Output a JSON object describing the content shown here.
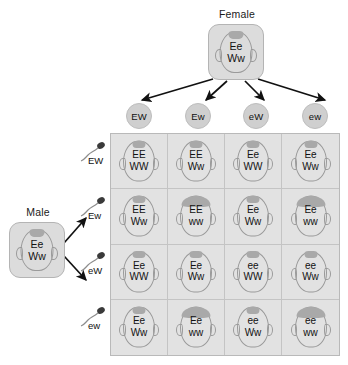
{
  "diagram": {
    "title_female": "Female",
    "title_male": "Male",
    "female_genotype_line1": "Ee",
    "female_genotype_line2": "Ww",
    "male_genotype_line1": "Ee",
    "male_genotype_line2": "Ww",
    "arrow_color": "#111111",
    "box_fill": "#dcdcdc",
    "box_stroke": "#b4b4b4",
    "grid_fill": "#e2e2e2",
    "grid_line": "#c4c4c4",
    "hair_color": "#a9a9a9",
    "outline_color": "#9a9a9a"
  },
  "eggs": [
    {
      "label": "EW"
    },
    {
      "label": "Ew"
    },
    {
      "label": "eW"
    },
    {
      "label": "ew"
    }
  ],
  "sperm": [
    {
      "label": "EW"
    },
    {
      "label": "Ew"
    },
    {
      "label": "eW"
    },
    {
      "label": "ew"
    }
  ],
  "chart_data": {
    "type": "table",
    "xlabel": "Female gametes",
    "ylabel": "Male gametes",
    "categories": [
      "EW",
      "Ew",
      "eW",
      "ew"
    ],
    "row_categories": [
      "EW",
      "Ew",
      "eW",
      "ew"
    ],
    "cells": [
      [
        {
          "line1": "EE",
          "line2": "WW",
          "hair": "peak"
        },
        {
          "line1": "EE",
          "line2": "Ww",
          "hair": "peak"
        },
        {
          "line1": "Ee",
          "line2": "WW",
          "hair": "peak"
        },
        {
          "line1": "Ee",
          "line2": "Ww",
          "hair": "peak"
        }
      ],
      [
        {
          "line1": "EE",
          "line2": "Ww",
          "hair": "peak"
        },
        {
          "line1": "EE",
          "line2": "ww",
          "hair": "full"
        },
        {
          "line1": "Ee",
          "line2": "Ww",
          "hair": "peak"
        },
        {
          "line1": "Ee",
          "line2": "ww",
          "hair": "full"
        }
      ],
      [
        {
          "line1": "Ee",
          "line2": "WW",
          "hair": "peak"
        },
        {
          "line1": "Ee",
          "line2": "Ww",
          "hair": "peak"
        },
        {
          "line1": "ee",
          "line2": "WW",
          "hair": "peak"
        },
        {
          "line1": "ee",
          "line2": "Ww",
          "hair": "peak"
        }
      ],
      [
        {
          "line1": "Ee",
          "line2": "Ww",
          "hair": "peak"
        },
        {
          "line1": "Ee",
          "line2": "ww",
          "hair": "full"
        },
        {
          "line1": "ee",
          "line2": "Ww",
          "hair": "peak"
        },
        {
          "line1": "ee",
          "line2": "ww",
          "hair": "full"
        }
      ]
    ]
  }
}
